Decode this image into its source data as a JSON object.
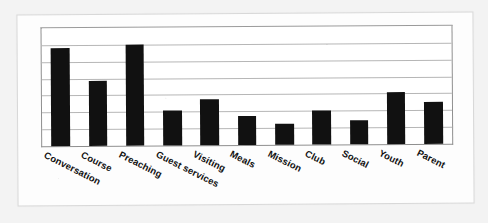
{
  "figure": {
    "background_color": "#f3f3f3",
    "paper_color": "#fdfdfd",
    "bar_color": "#111111",
    "gridline_color": "#b6b6b6",
    "axis_color": "#8f8f8f"
  },
  "chart_data": {
    "type": "bar",
    "title": "",
    "subtitle": "",
    "xlabel": "",
    "ylabel": "",
    "categories": [
      "Conversation",
      "Course",
      "Preaching",
      "Guest services",
      "Visiting",
      "Meals",
      "Mission",
      "Club",
      "Social",
      "Youth",
      "Parent"
    ],
    "values": [
      3.5,
      2.3,
      3.6,
      1.25,
      1.65,
      1.05,
      0.75,
      1.2,
      0.85,
      1.85,
      1.5
    ],
    "ylim": [
      0,
      4.2
    ],
    "gridlines": [
      0.6,
      1.2,
      1.8,
      2.4,
      3.0,
      3.6
    ],
    "grid": true,
    "legend": "none",
    "tick_labels_y": [],
    "annotations": []
  }
}
